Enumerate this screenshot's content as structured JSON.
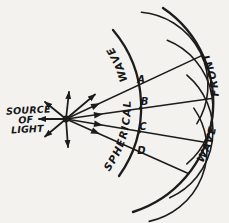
{
  "diagram": {
    "source_label": {
      "line1": "SOURCE",
      "line2": "OF",
      "line3": "LIGHT"
    },
    "spherical_wave_label": "SPHERICAL WAVE",
    "wave_front_label": "WAVE FRONT",
    "point_labels": {
      "a": "A",
      "b": "B",
      "c": "C",
      "d": "D"
    },
    "colors": {
      "ink": "#1c1c1c",
      "paper": "#f3f2ee"
    }
  }
}
